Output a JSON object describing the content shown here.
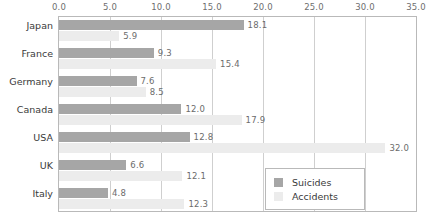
{
  "chart_data": {
    "type": "bar",
    "orientation": "horizontal",
    "title": "",
    "xlabel": "",
    "ylabel": "",
    "xlim": [
      0.0,
      35.0
    ],
    "xticks": [
      "0.0",
      "5.0",
      "10.0",
      "15.0",
      "20.0",
      "25.0",
      "30.0",
      "35.0"
    ],
    "xtick_values": [
      0,
      5,
      10,
      15,
      20,
      25,
      30,
      35
    ],
    "axis_position": "top",
    "grid": "vertical",
    "legend_position": "bottom-right-inside",
    "categories": [
      "Japan",
      "France",
      "Germany",
      "Canada",
      "USA",
      "UK",
      "Italy"
    ],
    "series": [
      {
        "name": "Suicides",
        "color": "#a6a6a6",
        "values": [
          18.1,
          9.3,
          7.6,
          12.0,
          12.8,
          6.6,
          4.8
        ],
        "labels": [
          "18.1",
          "9.3",
          "7.6",
          "12.0",
          "12.8",
          "6.6",
          "4.8"
        ]
      },
      {
        "name": "Accidents",
        "color": "#ececec",
        "values": [
          5.9,
          15.4,
          8.5,
          17.9,
          32.0,
          12.1,
          12.3
        ],
        "labels": [
          "5.9",
          "15.4",
          "8.5",
          "17.9",
          "32.0",
          "12.1",
          "12.3"
        ]
      }
    ]
  },
  "legend": {
    "items": [
      {
        "label": "Suicides",
        "swatch": "suicides"
      },
      {
        "label": "Accidents",
        "swatch": "accidents"
      }
    ]
  },
  "colors": {
    "suicides": "#a6a6a6",
    "accidents": "#ececec",
    "gridline": "#cfcfcf",
    "plot_border": "#b9b9b9",
    "tick_text": "#6e6e6e",
    "label_text": "#3a3a3a"
  }
}
